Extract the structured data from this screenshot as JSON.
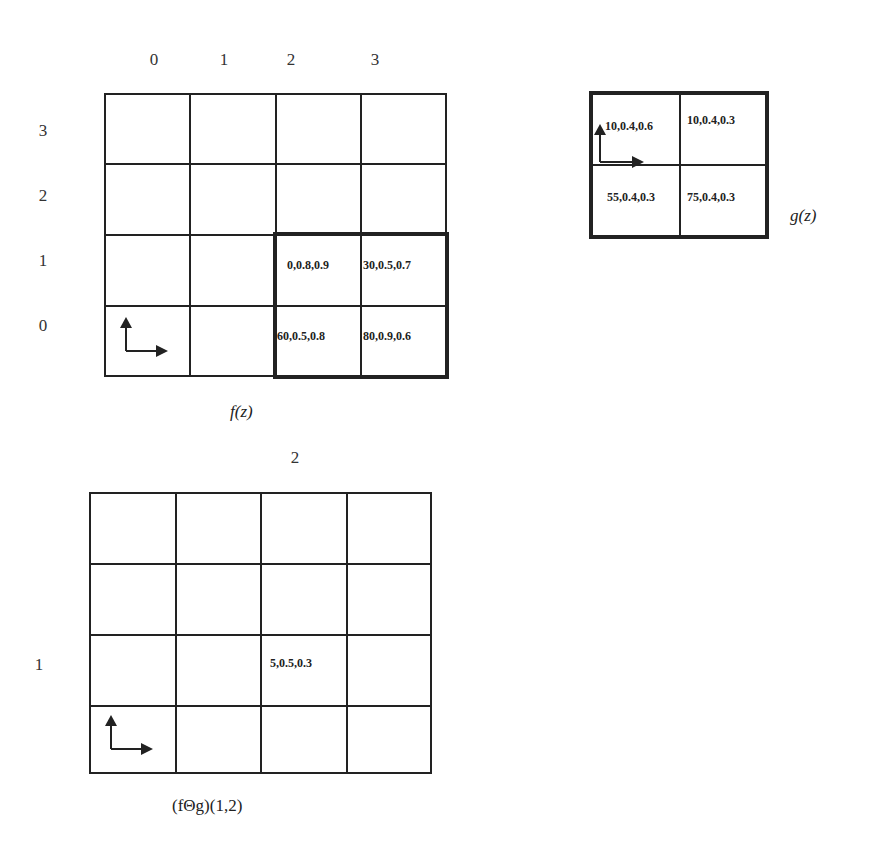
{
  "f_grid": {
    "caption": "f(z)",
    "col_labels": [
      "0",
      "1",
      "2",
      "3"
    ],
    "row_labels": [
      "3",
      "2",
      "1",
      "0"
    ],
    "cells": {
      "r1c2": "0,0.8,0.9",
      "r1c3": "30,0.5,0.7",
      "r0c2": "60,0.5,0.8",
      "r0c3": "80,0.9,0.6"
    }
  },
  "g_grid": {
    "caption": "g(z)",
    "cells": {
      "r1c0": "10,0.4,0.6",
      "r1c1": "10,0.4,0.3",
      "r0c0": "55,0.4,0.3",
      "r0c1": "75,0.4,0.3"
    }
  },
  "result_grid": {
    "caption": "(fΘg)(1,2)",
    "col_label": "2",
    "row_label": "1",
    "cells": {
      "r1c2": "5,0.5,0.3"
    }
  },
  "icons": {
    "axes": "origin-axes-icon"
  }
}
